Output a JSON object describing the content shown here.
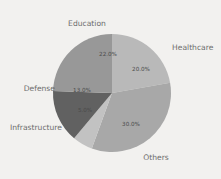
{
  "chart_data": {
    "type": "pie",
    "title": "",
    "subtitle": "",
    "xlabel": "",
    "ylabel": "",
    "legend_position": "none",
    "grid": false,
    "start_angle_deg": 0,
    "direction": "clockwise",
    "categories": [
      "Healthcare",
      "Others",
      "Infrastructure",
      "Defense",
      "Education"
    ],
    "values": [
      20.0,
      30.0,
      5.0,
      13.0,
      22.0
    ],
    "value_unit": "%",
    "total_labeled": 90.0,
    "slices": [
      {
        "label": "Healthcare",
        "value": 20.0,
        "pct_text": "20.0%",
        "color": "#b9b9b9",
        "label_anchor": "start",
        "label_x": 172,
        "label_y": 48,
        "pct_x": 141,
        "pct_y": 69
      },
      {
        "label": "Others",
        "value": 30.0,
        "pct_text": "30.0%",
        "color": "#a8a8a8",
        "label_anchor": "middle",
        "label_x": 156,
        "label_y": 158,
        "pct_x": 131,
        "pct_y": 124
      },
      {
        "label": "Infrastructure",
        "value": 5.0,
        "pct_text": "5.0%",
        "color": "#c2c2c2",
        "label_anchor": "end",
        "label_x": 62,
        "label_y": 128,
        "pct_x": 85,
        "pct_y": 110
      },
      {
        "label": "Defense",
        "value": 13.0,
        "pct_text": "13.0%",
        "color": "#616161",
        "label_anchor": "end",
        "label_x": 55,
        "label_y": 89,
        "pct_x": 82,
        "pct_y": 90
      },
      {
        "label": "Education",
        "value": 22.0,
        "pct_text": "22.0%",
        "color": "#989898",
        "label_anchor": "middle",
        "label_x": 87,
        "label_y": 24,
        "pct_x": 108,
        "pct_y": 54
      }
    ],
    "geometry": {
      "center_x": 112,
      "center_y": 93,
      "radius": 59
    },
    "background_color": "#f2f1ef",
    "label_color": "#6d6d6d",
    "pct_color": "#4a4a4a"
  }
}
